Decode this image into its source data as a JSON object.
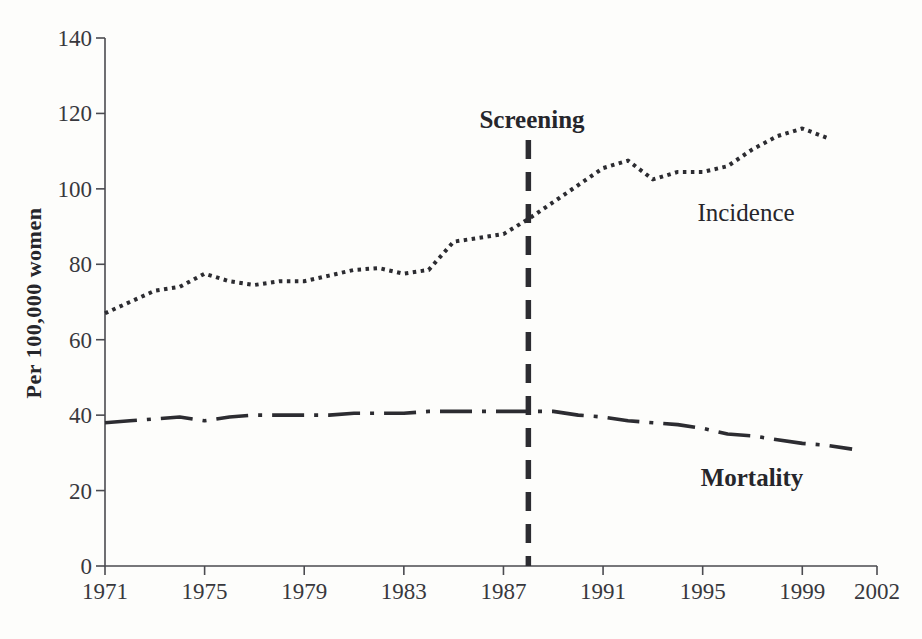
{
  "figure": {
    "background": "#fdfdfb",
    "ink_color": "#2c2c31",
    "axis_color": "#4b4b50",
    "tick_label_color": "#38383d"
  },
  "labels": {
    "y_axis": "Per 100,000 women",
    "screening": "Screening",
    "incidence": "Incidence",
    "mortality": "Mortality"
  },
  "chart_data": {
    "type": "line",
    "title": "",
    "xlabel": "",
    "ylabel": "Per 100,000 women",
    "xlim": [
      1971,
      2002
    ],
    "ylim": [
      0,
      140
    ],
    "x_ticks": [
      1971,
      1975,
      1979,
      1983,
      1987,
      1991,
      1995,
      1999,
      2002
    ],
    "y_ticks": [
      0,
      20,
      40,
      60,
      80,
      100,
      120,
      140
    ],
    "grid": false,
    "legend_position": "inline-labels",
    "annotations": [
      {
        "type": "vline",
        "x": 1988,
        "label": "Screening",
        "style": "dashed"
      }
    ],
    "series": [
      {
        "name": "Incidence",
        "style": "dotted",
        "x": [
          1971,
          1972,
          1973,
          1974,
          1975,
          1976,
          1977,
          1978,
          1979,
          1980,
          1981,
          1982,
          1983,
          1984,
          1985,
          1986,
          1987,
          1988,
          1989,
          1990,
          1991,
          1992,
          1993,
          1994,
          1995,
          1996,
          1997,
          1998,
          1999,
          2000
        ],
        "values": [
          67,
          70,
          73,
          74,
          77.5,
          75.5,
          74.5,
          75.5,
          75.5,
          77,
          78.5,
          79,
          77.5,
          78.5,
          86,
          87,
          88,
          92,
          96.5,
          101,
          105.5,
          107.5,
          102.5,
          104.5,
          104.5,
          106,
          110.5,
          114,
          116,
          113.5
        ]
      },
      {
        "name": "Mortality",
        "style": "dash-dot",
        "x": [
          1971,
          1972,
          1973,
          1974,
          1975,
          1976,
          1977,
          1978,
          1979,
          1980,
          1981,
          1982,
          1983,
          1984,
          1985,
          1986,
          1987,
          1988,
          1989,
          1990,
          1991,
          1992,
          1993,
          1994,
          1995,
          1996,
          1997,
          1998,
          1999,
          2000,
          2001
        ],
        "values": [
          38,
          38.5,
          39,
          39.5,
          38.5,
          39.5,
          40,
          40,
          40,
          40,
          40.5,
          40.5,
          40.5,
          41,
          41,
          41,
          41,
          41,
          41,
          40,
          39.5,
          38.5,
          38,
          37.5,
          36.5,
          35,
          34.5,
          33.5,
          32.5,
          32,
          31
        ]
      }
    ]
  }
}
